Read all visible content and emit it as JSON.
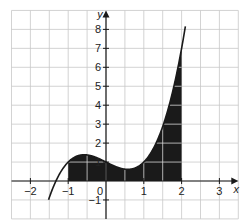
{
  "chart_data": {
    "type": "line",
    "title": "",
    "xlabel": "x",
    "ylabel": "y",
    "function": "y = x^3 - x + 1",
    "xlim": [
      -2.5,
      3.5
    ],
    "ylim": [
      -2,
      9
    ],
    "grid": true,
    "grid_step": 0.5,
    "x_ticks": [
      -2,
      -1,
      0,
      1,
      2,
      3
    ],
    "y_ticks": [
      -1,
      1,
      2,
      3,
      4,
      5,
      6,
      7,
      8
    ],
    "x_tick_labels": [
      "−2",
      "−1",
      "0",
      "1",
      "2",
      "3"
    ],
    "y_tick_labels": [
      "−1",
      "1",
      "2",
      "3",
      "4",
      "5",
      "6",
      "7",
      "8"
    ],
    "origin_label": "0",
    "curve_domain": [
      -1.52,
      2.1
    ],
    "shaded_region": {
      "from_x": -1,
      "to_x": 2,
      "between": "curve and x-axis"
    },
    "key_points": [
      {
        "x": -1.5,
        "y": -0.875
      },
      {
        "x": -1,
        "y": 1
      },
      {
        "x": -0.577,
        "y": 1.385
      },
      {
        "x": 0,
        "y": 1
      },
      {
        "x": 0.577,
        "y": 0.615
      },
      {
        "x": 1,
        "y": 1
      },
      {
        "x": 1.5,
        "y": 3.875
      },
      {
        "x": 2,
        "y": 7
      },
      {
        "x": 2.1,
        "y": 8.161
      }
    ],
    "colors": {
      "curve": "#1a1a1a",
      "shade": "#1a1a1a",
      "grid": "#c8c8c8",
      "axes": "#1a1a1a",
      "background": "#ffffff"
    }
  }
}
